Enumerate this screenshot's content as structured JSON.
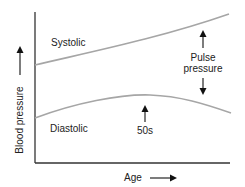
{
  "diagram": {
    "title": "",
    "y_axis": {
      "label": "Blood pressure",
      "arrow": "arrow-right-icon"
    },
    "x_axis": {
      "label": "Age",
      "arrow": "arrow-right-icon"
    },
    "curves": [
      {
        "name": "Systolic",
        "trend": "rises steadily with age"
      },
      {
        "name": "Diastolic",
        "trend": "rises until the 50s, then declines"
      }
    ],
    "annotations": {
      "pulse_pressure": {
        "line1": "Pulse",
        "line2": "pressure"
      },
      "peak": "50s"
    },
    "colors": {
      "curve": "#a6a6a6",
      "axis": "#333333",
      "text": "#222222"
    }
  }
}
